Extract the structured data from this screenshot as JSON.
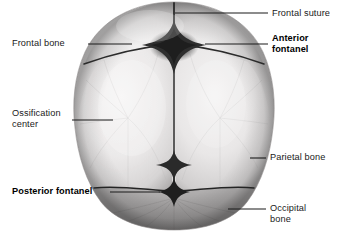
{
  "figure": {
    "background_color": "#ffffff",
    "text_color": "#1a1a1a",
    "leader_line_color": "#1a1a1a"
  },
  "labels": {
    "frontal_suture": {
      "text": "Frontal suture",
      "bold": false,
      "side": "right"
    },
    "anterior_fontanel": {
      "line1": "Anterior",
      "line2": "fontanel",
      "bold": true,
      "side": "right"
    },
    "frontal_bone": {
      "text": "Frontal bone",
      "bold": false,
      "side": "left"
    },
    "ossification_center": {
      "line1": "Ossification",
      "line2": "center",
      "bold": false,
      "side": "left"
    },
    "parietal_bone": {
      "text": "Parietal bone",
      "bold": false,
      "side": "right"
    },
    "posterior_fontanel": {
      "text": "Posterior fontanel",
      "bold": true,
      "side": "left"
    },
    "occipital_bone": {
      "line1": "Occipital",
      "line2": "bone",
      "bold": false,
      "side": "right"
    }
  },
  "anatomy": {
    "bones": [
      "Frontal bone",
      "Parietal bone",
      "Occipital bone"
    ],
    "fontanels": [
      "Anterior fontanel",
      "Posterior fontanel"
    ],
    "sutures": [
      "Frontal suture",
      "Coronal suture",
      "Sagittal suture",
      "Lambdoid suture"
    ],
    "tones": {
      "skull_light": "#eceaea",
      "skull_mid": "#d4d2d2",
      "skull_shadow": "#a9a7a7",
      "occipital_gray": "#9b9999",
      "suture_dark": "#2a2a2a",
      "fontanel_dark": "#3a3a3a"
    }
  }
}
